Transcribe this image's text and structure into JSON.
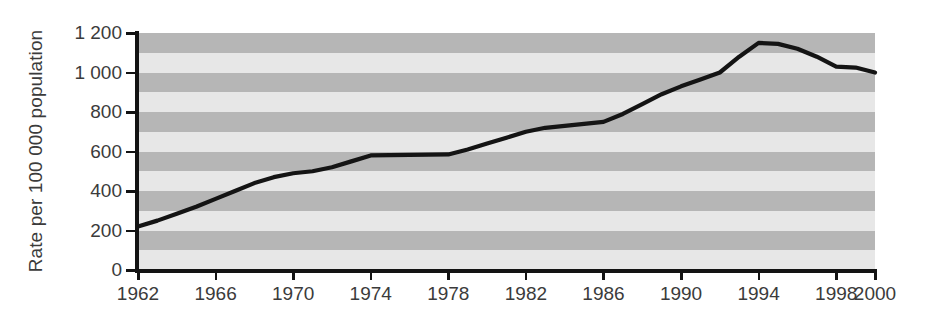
{
  "chart_data": {
    "type": "line",
    "title": "",
    "xlabel": "",
    "ylabel": "Rate per 100 000 population",
    "xlim": [
      1962,
      2000
    ],
    "ylim": [
      0,
      1200
    ],
    "grid": false,
    "legend": null,
    "y_ticks": [
      0,
      200,
      400,
      600,
      800,
      1000,
      1200
    ],
    "y_tick_labels": [
      "0",
      "200",
      "400",
      "600",
      "800",
      "1 000",
      "1 200"
    ],
    "x_ticks": [
      1962,
      1966,
      1970,
      1974,
      1978,
      1982,
      1986,
      1990,
      1994,
      1998,
      2000
    ],
    "x_tick_labels": [
      "1962",
      "1966",
      "1970",
      "1974",
      "1978",
      "1982",
      "1986",
      "1990",
      "1994",
      "1998",
      "2000"
    ],
    "band_interval": 100,
    "band_color_dark": "#b6b6b6",
    "band_color_light": "#e7e7e7",
    "line_color": "#141414",
    "axis_color": "#131313",
    "text_color": "#3b3b3b",
    "series": [
      {
        "name": "Rate per 100 000 population",
        "x": [
          1962,
          1963,
          1964,
          1965,
          1966,
          1967,
          1968,
          1969,
          1970,
          1971,
          1972,
          1973,
          1974,
          1975,
          1976,
          1977,
          1978,
          1979,
          1980,
          1981,
          1982,
          1983,
          1984,
          1985,
          1986,
          1987,
          1988,
          1989,
          1990,
          1991,
          1992,
          1993,
          1994,
          1995,
          1996,
          1997,
          1998,
          1999,
          2000
        ],
        "values": [
          220,
          250,
          285,
          320,
          360,
          400,
          440,
          470,
          490,
          500,
          520,
          550,
          580,
          582,
          583,
          584,
          585,
          610,
          640,
          670,
          700,
          720,
          730,
          740,
          750,
          790,
          840,
          890,
          930,
          965,
          1000,
          1080,
          1150,
          1145,
          1120,
          1080,
          1030,
          1025,
          1000
        ]
      }
    ]
  }
}
